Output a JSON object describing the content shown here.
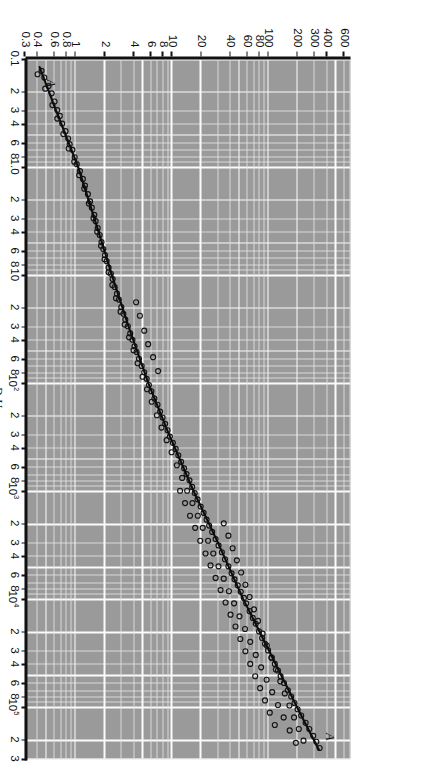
{
  "figure": {
    "background_color": "#9a9a9a",
    "grid_color": "#f5f5f5",
    "marker_color": "#141414",
    "line_color": "#0d0d0d",
    "rotation_note": "90"
  },
  "axes": {
    "x": {
      "label_prefix": "Re",
      "label_prefix_sub": "f",
      "label_eq": "=",
      "numerator_main": "D",
      "numerator_main_sub": "0",
      "numerator_second": "U",
      "numerator_second_sub": "∞",
      "denominator_main": "ν",
      "denominator_main_sub": "f",
      "scale": "log",
      "min": 0.1,
      "max": 300000,
      "ticks": [
        {
          "value": 0.1,
          "label": "0.1"
        },
        {
          "value": 0.2,
          "label": "2"
        },
        {
          "value": 0.3,
          "label": "3"
        },
        {
          "value": 0.4,
          "label": "4"
        },
        {
          "value": 0.6,
          "label": "6"
        },
        {
          "value": 0.8,
          "label": "8"
        },
        {
          "value": 1.0,
          "label": "1.0"
        },
        {
          "value": 2,
          "label": "2"
        },
        {
          "value": 3,
          "label": "3"
        },
        {
          "value": 4,
          "label": "4"
        },
        {
          "value": 6,
          "label": "6"
        },
        {
          "value": 8,
          "label": "8"
        },
        {
          "value": 10,
          "label": "10"
        },
        {
          "value": 20,
          "label": "2"
        },
        {
          "value": 30,
          "label": "3"
        },
        {
          "value": 40,
          "label": "4"
        },
        {
          "value": 60,
          "label": "6"
        },
        {
          "value": 80,
          "label": "8"
        },
        {
          "value": 100,
          "label": "10",
          "exp": "2"
        },
        {
          "value": 200,
          "label": "2"
        },
        {
          "value": 300,
          "label": "3"
        },
        {
          "value": 400,
          "label": "4"
        },
        {
          "value": 600,
          "label": "6"
        },
        {
          "value": 800,
          "label": "8"
        },
        {
          "value": 1000,
          "label": "10",
          "exp": "3"
        },
        {
          "value": 2000,
          "label": "2"
        },
        {
          "value": 3000,
          "label": "3"
        },
        {
          "value": 4000,
          "label": "4"
        },
        {
          "value": 6000,
          "label": "6"
        },
        {
          "value": 8000,
          "label": "8"
        },
        {
          "value": 10000,
          "label": "10",
          "exp": "4"
        },
        {
          "value": 20000,
          "label": "2"
        },
        {
          "value": 30000,
          "label": "3"
        },
        {
          "value": 40000,
          "label": "4"
        },
        {
          "value": 60000,
          "label": "6"
        },
        {
          "value": 80000,
          "label": "8"
        },
        {
          "value": 100000,
          "label": "10",
          "exp": "5"
        },
        {
          "value": 200000,
          "label": "2"
        },
        {
          "value": 300000,
          "label": "3"
        }
      ]
    },
    "y": {
      "numerator_main": "h",
      "numerator_second": "D",
      "numerator_second_sub": "0",
      "denominator_main": "k",
      "denominator_main_sub": "f",
      "scale": "log",
      "min": 0.3,
      "max": 700,
      "ticks": [
        {
          "value": 0.3,
          "label": "0.3"
        },
        {
          "value": 0.4,
          "label": "0.4"
        },
        {
          "value": 0.6,
          "label": "0.6"
        },
        {
          "value": 0.8,
          "label": "0.8"
        },
        {
          "value": 1,
          "label": "1"
        },
        {
          "value": 2,
          "label": "2"
        },
        {
          "value": 4,
          "label": "4"
        },
        {
          "value": 6,
          "label": "6"
        },
        {
          "value": 8,
          "label": "8"
        },
        {
          "value": 10,
          "label": "10"
        },
        {
          "value": 20,
          "label": "20"
        },
        {
          "value": 40,
          "label": "40"
        },
        {
          "value": 60,
          "label": "60"
        },
        {
          "value": 80,
          "label": "80"
        },
        {
          "value": 100,
          "label": "100"
        },
        {
          "value": 200,
          "label": "200"
        },
        {
          "value": 300,
          "label": "300"
        },
        {
          "value": 400,
          "label": "400"
        },
        {
          "value": 600,
          "label": "600"
        }
      ]
    }
  },
  "annotations": [
    {
      "id": "ann-a-low",
      "text": "A",
      "x": 0.17,
      "y": 0.55
    },
    {
      "id": "ann-a-high",
      "text": "A",
      "x": 190000,
      "y": 420
    }
  ],
  "chart_data": {
    "type": "scatter",
    "title": "",
    "subtitle": "",
    "xlabel": "Re_f = D_0 U_inf / nu_f",
    "ylabel": "h_bar D_0 / k_f",
    "xscale": "log",
    "yscale": "log",
    "xlim": [
      0.1,
      300000
    ],
    "ylim": [
      0.3,
      700
    ],
    "grid": true,
    "legend": false,
    "series": [
      {
        "name": "Correlation line A-A",
        "type": "line",
        "x": [
          0.12,
          0.3,
          1.0,
          3.0,
          10,
          30,
          100,
          300,
          1000,
          3000,
          10000,
          30000,
          100000,
          250000
        ],
        "y": [
          0.42,
          0.62,
          1.05,
          1.55,
          2.35,
          3.5,
          5.6,
          9.2,
          16.5,
          29.5,
          54,
          100,
          195,
          330
        ]
      },
      {
        "name": "Experimental data (open circles)",
        "type": "scatter",
        "marker": "o",
        "points": [
          [
            0.13,
            0.44
          ],
          [
            0.15,
            0.47
          ],
          [
            0.18,
            0.52
          ],
          [
            0.21,
            0.56
          ],
          [
            0.25,
            0.6
          ],
          [
            0.3,
            0.64
          ],
          [
            0.34,
            0.68
          ],
          [
            0.4,
            0.72
          ],
          [
            0.47,
            0.78
          ],
          [
            0.55,
            0.83
          ],
          [
            0.62,
            0.86
          ],
          [
            0.7,
            0.92
          ],
          [
            0.82,
            0.97
          ],
          [
            0.95,
            1.02
          ],
          [
            1.1,
            1.1
          ],
          [
            1.3,
            1.18
          ],
          [
            1.5,
            1.24
          ],
          [
            1.8,
            1.33
          ],
          [
            2.1,
            1.4
          ],
          [
            2.4,
            1.46
          ],
          [
            2.8,
            1.55
          ],
          [
            3.2,
            1.6
          ],
          [
            3.7,
            1.68
          ],
          [
            4.3,
            1.76
          ],
          [
            5.0,
            1.84
          ],
          [
            5.8,
            1.92
          ],
          [
            6.6,
            2.0
          ],
          [
            7.5,
            2.08
          ],
          [
            8.6,
            2.18
          ],
          [
            9.8,
            2.3
          ],
          [
            11,
            2.4
          ],
          [
            13,
            2.52
          ],
          [
            15,
            2.66
          ],
          [
            17,
            2.78
          ],
          [
            20,
            2.95
          ],
          [
            23,
            3.1
          ],
          [
            26,
            3.25
          ],
          [
            30,
            3.45
          ],
          [
            35,
            3.65
          ],
          [
            40,
            3.85
          ],
          [
            46,
            4.05
          ],
          [
            52,
            4.25
          ],
          [
            60,
            4.5
          ],
          [
            70,
            4.8
          ],
          [
            80,
            5.1
          ],
          [
            92,
            5.4
          ],
          [
            105,
            5.7
          ],
          [
            120,
            6.05
          ],
          [
            140,
            6.5
          ],
          [
            160,
            7.0
          ],
          [
            185,
            7.45
          ],
          [
            210,
            7.9
          ],
          [
            240,
            8.4
          ],
          [
            275,
            8.9
          ],
          [
            315,
            9.4
          ],
          [
            360,
            10.1
          ],
          [
            410,
            10.8
          ],
          [
            470,
            11.5
          ],
          [
            540,
            12.3
          ],
          [
            620,
            13.2
          ],
          [
            700,
            14.0
          ],
          [
            800,
            15.0
          ],
          [
            920,
            16.0
          ],
          [
            1050,
            17.0
          ],
          [
            1200,
            18.2
          ],
          [
            1400,
            19.6
          ],
          [
            1600,
            21.0
          ],
          [
            1850,
            22.6
          ],
          [
            2100,
            24.0
          ],
          [
            2400,
            25.8
          ],
          [
            2800,
            28.0
          ],
          [
            3200,
            30.0
          ],
          [
            3700,
            32.5
          ],
          [
            4300,
            35.0
          ],
          [
            5000,
            38.0
          ],
          [
            5800,
            41.0
          ],
          [
            6600,
            44.0
          ],
          [
            7500,
            47.5
          ],
          [
            8600,
            51.0
          ],
          [
            9800,
            55.0
          ],
          [
            11000,
            58.0
          ],
          [
            13000,
            63.0
          ],
          [
            15000,
            68.0
          ],
          [
            17000,
            73.0
          ],
          [
            20000,
            79.0
          ],
          [
            23000,
            85.0
          ],
          [
            26000,
            91.0
          ],
          [
            30000,
            98.0
          ],
          [
            35000,
            107
          ],
          [
            40000,
            115
          ],
          [
            46000,
            124
          ],
          [
            52000,
            132
          ],
          [
            60000,
            143
          ],
          [
            70000,
            157
          ],
          [
            80000,
            170
          ],
          [
            92000,
            184
          ],
          [
            105000,
            198
          ],
          [
            120000,
            216
          ],
          [
            140000,
            240
          ],
          [
            160000,
            262
          ],
          [
            185000,
            288
          ],
          [
            210000,
            310
          ],
          [
            240000,
            335
          ],
          [
            0.14,
            0.4
          ],
          [
            0.19,
            0.48
          ],
          [
            0.27,
            0.57
          ],
          [
            0.36,
            0.64
          ],
          [
            0.5,
            0.74
          ],
          [
            0.68,
            0.84
          ],
          [
            0.9,
            0.96
          ],
          [
            1.2,
            1.08
          ],
          [
            1.6,
            1.22
          ],
          [
            2.2,
            1.36
          ],
          [
            3.0,
            1.52
          ],
          [
            4.0,
            1.66
          ],
          [
            5.4,
            1.82
          ],
          [
            7.2,
            1.98
          ],
          [
            9.5,
            2.18
          ],
          [
            12.5,
            2.38
          ],
          [
            16.5,
            2.6
          ],
          [
            22,
            2.9
          ],
          [
            29,
            3.2
          ],
          [
            38,
            3.55
          ],
          [
            50,
            3.95
          ],
          [
            66,
            4.35
          ],
          [
            88,
            4.9
          ],
          [
            115,
            5.45
          ],
          [
            150,
            6.1
          ],
          [
            200,
            6.9
          ],
          [
            260,
            7.7
          ],
          [
            340,
            8.7
          ],
          [
            440,
            9.8
          ],
          [
            580,
            11.1
          ],
          [
            760,
            12.6
          ],
          [
            1000,
            14.2
          ],
          [
            1300,
            16.1
          ],
          [
            1700,
            18.3
          ],
          [
            2200,
            20.6
          ],
          [
            2900,
            23.4
          ],
          [
            3800,
            26.5
          ],
          [
            5000,
            30.0
          ],
          [
            6500,
            34.0
          ],
          [
            8500,
            38.5
          ],
          [
            11000,
            43.5
          ],
          [
            14500,
            49.5
          ],
          [
            19000,
            56.5
          ],
          [
            25000,
            64.0
          ],
          [
            33000,
            73.0
          ],
          [
            43000,
            83.0
          ],
          [
            56000,
            94.5
          ],
          [
            73000,
            108
          ],
          [
            96000,
            124
          ],
          [
            125000,
            142
          ],
          [
            165000,
            164
          ],
          [
            215000,
            190
          ],
          [
            18,
            4.2
          ],
          [
            24,
            4.6
          ],
          [
            33,
            5.1
          ],
          [
            44,
            5.6
          ],
          [
            58,
            6.3
          ],
          [
            78,
            7.1
          ],
          [
            2000,
            34.0
          ],
          [
            2600,
            38.0
          ],
          [
            3400,
            42.0
          ],
          [
            4400,
            46.5
          ],
          [
            5700,
            51.5
          ],
          [
            7400,
            57.0
          ],
          [
            9600,
            63.0
          ],
          [
            12500,
            70.0
          ],
          [
            16000,
            77.0
          ],
          [
            21000,
            86.0
          ],
          [
            27000,
            95.0
          ],
          [
            35000,
            106
          ],
          [
            45000,
            118
          ],
          [
            58000,
            131
          ],
          [
            75000,
            146
          ],
          [
            97000,
            163
          ],
          [
            125000,
            182
          ],
          [
            160000,
            204
          ],
          [
            205000,
            228
          ],
          [
            1000,
            12.0
          ],
          [
            1300,
            13.5
          ],
          [
            1700,
            15.2
          ],
          [
            2200,
            17.2
          ],
          [
            2900,
            19.4
          ],
          [
            3800,
            22.0
          ],
          [
            4900,
            24.8
          ],
          [
            6400,
            28.0
          ],
          [
            8300,
            31.5
          ],
          [
            10800,
            35.5
          ],
          [
            14000,
            40.0
          ],
          [
            18000,
            45.0
          ],
          [
            23500,
            50.5
          ],
          [
            30500,
            57.0
          ],
          [
            40000,
            64.0
          ],
          [
            52000,
            72.0
          ],
          [
            67000,
            81.0
          ],
          [
            87000,
            91.0
          ],
          [
            113000,
            102
          ],
          [
            147000,
            115
          ]
        ]
      }
    ]
  }
}
